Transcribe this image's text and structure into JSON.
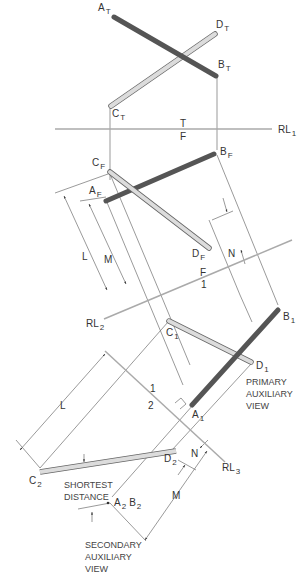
{
  "figure": {
    "colors": {
      "line_ab": "#5a5a5a",
      "line_cd": "#dcdcdc",
      "line_cd_outline": "#666666",
      "reference_line": "#aaaaaa",
      "projector": "#555555",
      "text": "#333333"
    }
  },
  "labels": {
    "A_T": {
      "base": "A",
      "sub": "T"
    },
    "B_T": {
      "base": "B",
      "sub": "T"
    },
    "C_T": {
      "base": "C",
      "sub": "T"
    },
    "D_T": {
      "base": "D",
      "sub": "T"
    },
    "A_F": {
      "base": "A",
      "sub": "F"
    },
    "B_F": {
      "base": "B",
      "sub": "F"
    },
    "C_F": {
      "base": "C",
      "sub": "F"
    },
    "D_F": {
      "base": "D",
      "sub": "F"
    },
    "A_1": {
      "base": "A",
      "sub": "1"
    },
    "B_1": {
      "base": "B",
      "sub": "1"
    },
    "C_1": {
      "base": "C",
      "sub": "1"
    },
    "D_1": {
      "base": "D",
      "sub": "1"
    },
    "C_2": {
      "base": "C",
      "sub": "2"
    },
    "D_2": {
      "base": "D",
      "sub": "2"
    },
    "A2B2": {
      "a": "A",
      "a_sub": "2",
      "b": "B",
      "b_sub": "2"
    },
    "RL1": {
      "base": "RL",
      "sub": "1"
    },
    "RL2": {
      "base": "RL",
      "sub": "2"
    },
    "RL3": {
      "base": "RL",
      "sub": "3"
    },
    "rl1_top": "T",
    "rl1_bottom": "F",
    "rl2_top": "F",
    "rl2_bottom": "1",
    "rl3_top": "1",
    "rl3_bottom": "2",
    "dim_L": "L",
    "dim_M": "M",
    "dim_N": "N",
    "dim_L2": "L",
    "dim_M2": "M",
    "dim_N2": "N"
  },
  "captions": {
    "primary": [
      "PRIMARY",
      "AUXILIARY",
      "VIEW"
    ],
    "secondary": [
      "SECONDARY",
      "AUXILIARY",
      "VIEW"
    ],
    "shortest": [
      "SHORTEST",
      "DISTANCE"
    ]
  }
}
